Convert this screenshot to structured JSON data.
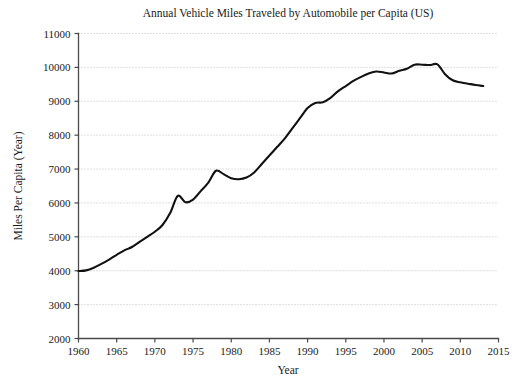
{
  "chart_data": {
    "type": "line",
    "title": "Annual Vehicle Miles Traveled by Automobile per Capita (US)",
    "xlabel": "Year",
    "ylabel": "Miles Per Capita (Year)",
    "xlim": [
      1960,
      2015
    ],
    "ylim": [
      2000,
      11000
    ],
    "grid": true,
    "grid_axis": "y",
    "legend": "none",
    "line_color": "#111111",
    "xticks": [
      1960,
      1965,
      1970,
      1975,
      1980,
      1985,
      1990,
      1995,
      2000,
      2005,
      2010,
      2015
    ],
    "xtick_labels": [
      "1960",
      "1965",
      "1970",
      "1975",
      "1980",
      "1985",
      "1990",
      "1995",
      "2000",
      "2005",
      "2010",
      "2015"
    ],
    "yticks": [
      2000,
      3000,
      4000,
      5000,
      6000,
      7000,
      8000,
      9000,
      10000,
      11000
    ],
    "ytick_labels": [
      "2000",
      "3000",
      "4000",
      "5000",
      "6000",
      "7000",
      "8000",
      "9000",
      "10000",
      "11000"
    ],
    "series": [
      {
        "name": "Annual Vehicle Miles Traveled per Capita",
        "x": [
          1960,
          1961,
          1962,
          1963,
          1964,
          1965,
          1966,
          1967,
          1968,
          1969,
          1970,
          1971,
          1972,
          1973,
          1974,
          1975,
          1976,
          1977,
          1978,
          1979,
          1980,
          1981,
          1982,
          1983,
          1984,
          1985,
          1986,
          1987,
          1988,
          1989,
          1990,
          1991,
          1992,
          1993,
          1994,
          1995,
          1996,
          1997,
          1998,
          1999,
          2000,
          2001,
          2002,
          2003,
          2004,
          2005,
          2006,
          2007,
          2008,
          2009,
          2010,
          2011,
          2012,
          2013
        ],
        "values": [
          3990,
          4010,
          4090,
          4200,
          4330,
          4470,
          4600,
          4700,
          4850,
          5000,
          5150,
          5350,
          5700,
          6210,
          6020,
          6100,
          6350,
          6600,
          6950,
          6850,
          6730,
          6700,
          6750,
          6900,
          7150,
          7400,
          7650,
          7900,
          8200,
          8500,
          8800,
          8950,
          8970,
          9100,
          9300,
          9450,
          9600,
          9720,
          9820,
          9880,
          9850,
          9820,
          9900,
          9960,
          10080,
          10080,
          10070,
          10090,
          9800,
          9620,
          9560,
          9520,
          9480,
          9450
        ]
      }
    ]
  },
  "figure": {
    "background_color": "#ffffff",
    "axis_color": "#4a4a4a",
    "grid_color": "#b9b9b9"
  }
}
